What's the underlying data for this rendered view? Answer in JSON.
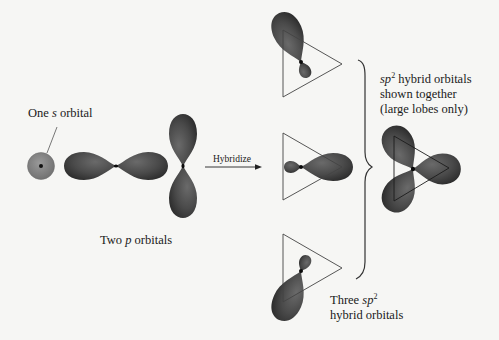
{
  "diagram": {
    "background": "#f6f6f4",
    "orbital_color": "#4a4a4a",
    "s_orbital_color": "#7d7d7d",
    "labels": {
      "s_orbital": {
        "pre": "One ",
        "italic": "s",
        "post": " orbital"
      },
      "p_orbitals": {
        "pre": "Two ",
        "italic": "p",
        "post": " orbitals"
      },
      "arrow": "Hybridize",
      "three_sp2": {
        "line1_pre": "Three ",
        "line1_italic": "sp",
        "line1_sup": "2",
        "line2": "hybrid orbitals"
      },
      "shown_together": {
        "line1_italic": "sp",
        "line1_sup": "2",
        "line1_post": " hybrid orbitals",
        "line2": "shown together",
        "line3": "(large lobes only)"
      }
    },
    "elements": [
      {
        "name": "s-orbital",
        "shape": "sphere"
      },
      {
        "name": "p-orbital-horizontal",
        "shape": "dumbbell"
      },
      {
        "name": "p-orbital-vertical",
        "shape": "dumbbell"
      },
      {
        "name": "hybridize-arrow",
        "shape": "arrow"
      },
      {
        "name": "sp2-orbital-upper",
        "shape": "lobe-in-triangle"
      },
      {
        "name": "sp2-orbital-middle",
        "shape": "lobe-in-triangle"
      },
      {
        "name": "sp2-orbital-lower",
        "shape": "lobe-in-triangle"
      },
      {
        "name": "grouping-brace",
        "shape": "curly-brace"
      },
      {
        "name": "sp2-combined",
        "shape": "trigonal-planar"
      }
    ]
  }
}
